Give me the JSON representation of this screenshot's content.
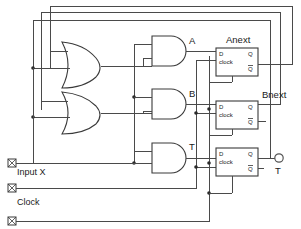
{
  "diagram": {
    "kind": "logic-schematic",
    "background_color": "#ffffff",
    "wire_color": "#4a4a4a"
  },
  "inputs": [
    {
      "id": "input-x",
      "label": "Input X",
      "pin_icon": "input-pin-icon"
    },
    {
      "id": "clock",
      "label": "Clock",
      "pin_icon": "input-pin-icon"
    },
    {
      "id": "input-bottom",
      "label": "",
      "pin_icon": "input-pin-icon"
    }
  ],
  "or_gates": [
    {
      "id": "or-gate-upper",
      "label": "",
      "inputs": 2
    },
    {
      "id": "or-gate-lower",
      "label": "",
      "inputs": 2
    }
  ],
  "and_gates": [
    {
      "id": "and-gate-a",
      "label": "A",
      "inputs": 2
    },
    {
      "id": "and-gate-b",
      "label": "B",
      "inputs": 2
    },
    {
      "id": "and-gate-t",
      "label": "T",
      "inputs": 2
    }
  ],
  "flip_flops": [
    {
      "id": "flipflop-anext",
      "title": "Anext",
      "d_label": "D",
      "clock_label": "clock",
      "q_label": "Q",
      "qbar_label": "Q"
    },
    {
      "id": "flipflop-bnext",
      "title": "Bnext",
      "d_label": "D",
      "clock_label": "clock",
      "q_label": "Q",
      "qbar_label": "Q"
    },
    {
      "id": "flipflop-t",
      "title": "",
      "d_label": "D",
      "clock_label": "clock",
      "q_label": "Q",
      "qbar_label": "Q"
    }
  ],
  "outputs": [
    {
      "id": "output-t",
      "label": "T",
      "terminal": "output-terminal-icon"
    }
  ],
  "net_labels": {
    "a": "A",
    "b": "B",
    "t": "T",
    "anext": "Anext",
    "bnext": "Bnext",
    "out_t": "T"
  }
}
